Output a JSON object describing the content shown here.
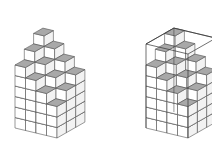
{
  "figures": [
    {
      "name": "cube-stack-left",
      "origin": [
        57,
        138
      ],
      "show_bounding_box": false,
      "show_hidden_edge": false
    },
    {
      "name": "cube-stack-right-in-box",
      "origin": [
        188,
        138
      ],
      "show_bounding_box": true,
      "show_hidden_edge": true
    }
  ],
  "structure": {
    "width": 4,
    "depth": 3,
    "heights": [
      [
        8,
        7,
        6
      ],
      [
        7,
        6,
        5
      ],
      [
        6,
        5,
        4
      ],
      [
        5,
        4,
        3
      ]
    ]
  },
  "colors": {
    "top_face": "#a8a8a8",
    "left_face": "#ffffff",
    "right_face": "#f2f2f2",
    "edge": "#555555",
    "box_edge": "#333333"
  }
}
